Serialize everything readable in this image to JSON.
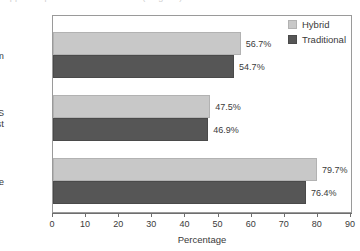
{
  "caption_remnant": "clipped caption text above chart (illegible)",
  "chart_data": {
    "type": "bar",
    "orientation": "horizontal",
    "title": "",
    "xlabel": "Percentage",
    "ylabel": "",
    "xlim": [
      0,
      90
    ],
    "xticks": [
      0,
      10,
      20,
      30,
      40,
      50,
      60,
      70,
      80,
      90
    ],
    "grid": false,
    "legend_position": "top-right",
    "categories": [
      "Final exam",
      "CAOS posttest",
      "Pass rate"
    ],
    "series": [
      {
        "name": "Hybrid",
        "color": "#c8c8c8",
        "values": [
          56.7,
          47.5,
          79.7
        ],
        "labels": [
          "56.7%",
          "47.5%",
          "79.7%"
        ]
      },
      {
        "name": "Traditional",
        "color": "#565656",
        "values": [
          54.7,
          46.9,
          76.4
        ],
        "labels": [
          "54.7%",
          "46.9%",
          "76.4%"
        ]
      }
    ]
  },
  "axis": {
    "x_title": "Percentage",
    "tick_labels": [
      "0",
      "10",
      "20",
      "30",
      "40",
      "50",
      "60",
      "70",
      "80",
      "90"
    ]
  },
  "legend": {
    "items": [
      {
        "label": "Hybrid"
      },
      {
        "label": "Traditional"
      }
    ]
  },
  "category_labels": [
    "Final exam",
    "CAOS\nposttest",
    "Pass rate"
  ]
}
